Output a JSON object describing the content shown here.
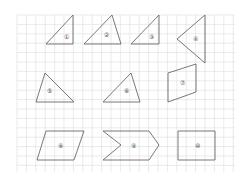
{
  "diagram": {
    "type": "grid-shapes",
    "grid": {
      "x0": 17,
      "y0": 15,
      "x1": 235,
      "y1": 172,
      "step": 9.4,
      "color": "#dcdcdc"
    },
    "stroke_color": "#6a6a6a",
    "shapes": [
      {
        "id": 1,
        "label": "①",
        "kind": "right-triangle",
        "points": [
          [
            73,
            15
          ],
          [
            46,
            44
          ],
          [
            73,
            44
          ]
        ],
        "label_pos": [
          66,
          37
        ]
      },
      {
        "id": 2,
        "label": "②",
        "kind": "triangle",
        "points": [
          [
            112,
            15
          ],
          [
            84,
            44
          ],
          [
            121,
            44
          ]
        ],
        "label_pos": [
          106,
          35
        ]
      },
      {
        "id": 3,
        "label": "③",
        "kind": "right-triangle",
        "points": [
          [
            159,
            15
          ],
          [
            131,
            44
          ],
          [
            159,
            44
          ]
        ],
        "label_pos": [
          151,
          37
        ]
      },
      {
        "id": 4,
        "label": "④",
        "kind": "triangle",
        "points": [
          [
            205,
            15
          ],
          [
            177,
            39
          ],
          [
            205,
            63
          ]
        ],
        "label_pos": [
          195,
          39
        ]
      },
      {
        "id": 5,
        "label": "⑤",
        "kind": "triangle",
        "points": [
          [
            45,
            73
          ],
          [
            36,
            102
          ],
          [
            74,
            102
          ]
        ],
        "label_pos": [
          49,
          91
        ]
      },
      {
        "id": 6,
        "label": "⑥",
        "kind": "triangle",
        "points": [
          [
            131,
            73
          ],
          [
            103,
            102
          ],
          [
            140,
            102
          ]
        ],
        "label_pos": [
          126,
          91
        ]
      },
      {
        "id": 7,
        "label": "⑦",
        "kind": "quadrilateral",
        "points": [
          [
            168,
            73
          ],
          [
            196,
            64
          ],
          [
            196,
            92
          ],
          [
            168,
            102
          ]
        ],
        "label_pos": [
          182,
          83
        ]
      },
      {
        "id": 8,
        "label": "⑧",
        "kind": "parallelogram",
        "points": [
          [
            46,
            131
          ],
          [
            84,
            131
          ],
          [
            74,
            160
          ],
          [
            37,
            160
          ]
        ],
        "label_pos": [
          60,
          146
        ]
      },
      {
        "id": 9,
        "label": "⑨",
        "kind": "chevron",
        "points": [
          [
            103,
            131
          ],
          [
            149,
            131
          ],
          [
            159,
            145
          ],
          [
            149,
            160
          ],
          [
            103,
            160
          ],
          [
            121,
            145
          ]
        ],
        "label_pos": [
          133,
          146
        ]
      },
      {
        "id": 10,
        "label": "⑩",
        "kind": "rectangle",
        "points": [
          [
            178,
            131
          ],
          [
            215,
            131
          ],
          [
            215,
            160
          ],
          [
            178,
            160
          ]
        ],
        "label_pos": [
          197,
          146
        ]
      }
    ]
  }
}
